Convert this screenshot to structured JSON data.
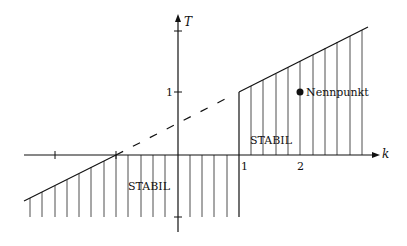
{
  "diagram": {
    "type": "stability-region-plot",
    "axes": {
      "x_label": "k",
      "y_label": "T",
      "x_ticks": [
        {
          "value": -2,
          "label": ""
        },
        {
          "value": -1,
          "label": ""
        },
        {
          "value": 1,
          "label": "1"
        },
        {
          "value": 2,
          "label": "2"
        }
      ],
      "y_ticks": [
        {
          "value": 2,
          "label": ""
        },
        {
          "value": 1,
          "label": "1"
        },
        {
          "value": -1,
          "label": ""
        }
      ]
    },
    "regions": [
      {
        "label": "STABIL",
        "location": "upper-right, k > 1, above T = (k+1)/2... bounded by axis"
      },
      {
        "label": "STABIL",
        "location": "lower, below k-axis, bounded left by line and right by k = 1"
      }
    ],
    "labels": {
      "region_upper": "STABIL",
      "region_lower": "STABIL",
      "point": "Nennpunkt",
      "x_axis": "k",
      "y_axis": "T",
      "tick_x1": "1",
      "tick_x2": "2",
      "tick_y1": "1"
    },
    "point": {
      "k": 2,
      "T": 1,
      "label": "Nennpunkt"
    },
    "lines": [
      {
        "style": "solid",
        "from": {
          "k": -2.5,
          "T": -0.75
        },
        "to": {
          "k": -1,
          "T": 0
        }
      },
      {
        "style": "dashed",
        "from": {
          "k": -1,
          "T": 0
        },
        "to": {
          "k": 1,
          "T": 1
        }
      },
      {
        "style": "solid",
        "from": {
          "k": 1,
          "T": 1
        },
        "to": {
          "k": 3.1,
          "T": 2.05
        }
      },
      {
        "style": "solid",
        "from": {
          "k": 1,
          "T": 1
        },
        "to": {
          "k": 1,
          "T": -1
        }
      }
    ]
  }
}
